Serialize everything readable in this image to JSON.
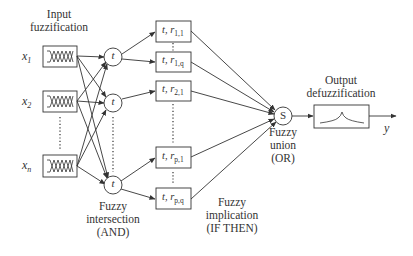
{
  "diagram": {
    "type": "fuzzy-inference-network",
    "stages": {
      "input": {
        "title_line1": "Input",
        "title_line2": "fuzzification"
      },
      "intersection": {
        "title_line1": "Fuzzy",
        "title_line2": "intersection",
        "title_line3": "(AND)"
      },
      "implication": {
        "title_line1": "Fuzzy",
        "title_line2": "implication",
        "title_line3": "(IF THEN)"
      },
      "union": {
        "title_line1": "Fuzzy",
        "title_line2": "union",
        "title_line3": "(OR)"
      },
      "output": {
        "title_line1": "Output",
        "title_line2": "defuzzification"
      }
    },
    "inputs": [
      {
        "var": "x",
        "sub": "1"
      },
      {
        "var": "x",
        "sub": "2"
      },
      {
        "var": "x",
        "sub": "n"
      }
    ],
    "t_nodes": [
      {
        "label": "t"
      },
      {
        "label": "t"
      },
      {
        "label": "t"
      }
    ],
    "rules": [
      {
        "t": "t,",
        "r": "r",
        "sub": "1,1"
      },
      {
        "t": "t,",
        "r": "r",
        "sub": "1,q"
      },
      {
        "t": "t,",
        "r": "r",
        "sub": "2,1"
      },
      {
        "t": "t,",
        "r": "r",
        "sub": "p,1"
      },
      {
        "t": "t,",
        "r": "r",
        "sub": "p,q"
      }
    ],
    "union_node": {
      "label": "S"
    },
    "output_var": "y"
  }
}
